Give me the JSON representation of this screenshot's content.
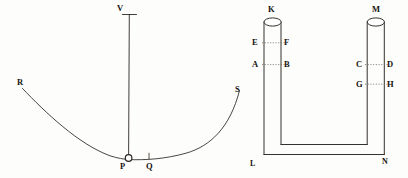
{
  "figure": {
    "background_color": "#fdfdfb",
    "ink_color": "#15120f",
    "line_color": "#2a2622",
    "dotted_color": "#6b6560",
    "panels": [
      {
        "name": "pendulum-arc-panel",
        "description": "Vertical suspension line from V down to bob at P resting on a concave arc running from R to S"
      },
      {
        "name": "u-tube-panel",
        "description": "U-shaped tube with two open vertical limbs topped by ellipses at K and M, joined at the bottom between L and N, with level marks E-F, A-B, C-D, G-H"
      }
    ],
    "labels": {
      "V": "V",
      "R": "R",
      "S": "S",
      "P": "P",
      "Q": "Q",
      "K": "K",
      "M": "M",
      "E": "E",
      "F": "F",
      "A": "A",
      "B": "B",
      "C": "C",
      "D": "D",
      "G": "G",
      "H": "H",
      "L": "L",
      "N": "N"
    },
    "label_positions": {
      "V": {
        "x": 117,
        "y": 4
      },
      "R": {
        "x": 17,
        "y": 78
      },
      "S": {
        "x": 235,
        "y": 85
      },
      "P": {
        "x": 120,
        "y": 162
      },
      "Q": {
        "x": 146,
        "y": 162
      },
      "K": {
        "x": 268,
        "y": 5
      },
      "M": {
        "x": 372,
        "y": 5
      },
      "E": {
        "x": 252,
        "y": 39
      },
      "F": {
        "x": 284,
        "y": 39
      },
      "A": {
        "x": 252,
        "y": 61
      },
      "B": {
        "x": 284,
        "y": 61
      },
      "C": {
        "x": 357,
        "y": 61
      },
      "D": {
        "x": 387,
        "y": 61
      },
      "G": {
        "x": 357,
        "y": 81
      },
      "H": {
        "x": 387,
        "y": 81
      },
      "L": {
        "x": 250,
        "y": 161
      },
      "N": {
        "x": 382,
        "y": 159
      }
    }
  }
}
